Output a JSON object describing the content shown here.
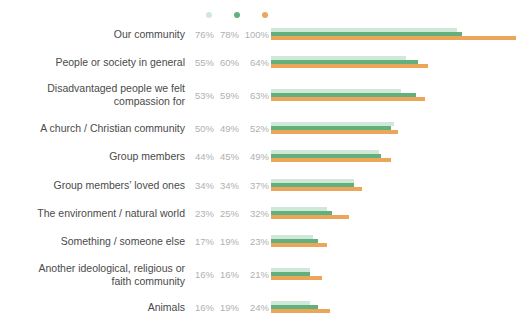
{
  "chart_data": {
    "type": "bar",
    "orientation": "horizontal",
    "title": "",
    "xlabel": "",
    "ylabel": "",
    "xlim": [
      0,
      100
    ],
    "grid": false,
    "legend_position": "top",
    "value_suffix": "%",
    "categories": [
      "Our community",
      "People or society in general",
      "Disadvantaged people we felt\ncompassion for",
      "A church / Christian community",
      "Group members",
      "Group members’ loved ones",
      "The environment / natural world",
      "Something / someone else",
      "Another ideological, religious or\nfaith community",
      "Animals"
    ],
    "series": [
      {
        "name": "series-1",
        "color": "#cfe8da",
        "values": [
          76,
          55,
          53,
          50,
          44,
          34,
          23,
          17,
          16,
          16
        ],
        "labels": [
          "76%",
          "55%",
          "53%",
          "50%",
          "44%",
          "34%",
          "23%",
          "17%",
          "16%",
          "16%"
        ]
      },
      {
        "name": "series-2",
        "color": "#62b07c",
        "values": [
          78,
          60,
          59,
          49,
          45,
          34,
          25,
          19,
          16,
          19
        ],
        "labels": [
          "78%",
          "60%",
          "59%",
          "49%",
          "45%",
          "34%",
          "25%",
          "19%",
          "16%",
          "19%"
        ]
      },
      {
        "name": "series-3",
        "color": "#eba65a",
        "values": [
          100,
          64,
          63,
          52,
          49,
          37,
          32,
          23,
          21,
          24
        ],
        "labels": [
          "100%",
          "64%",
          "63%",
          "52%",
          "49%",
          "37%",
          "32%",
          "23%",
          "21%",
          "24%"
        ]
      }
    ]
  },
  "colors": {
    "background": "#ffffff",
    "label_text": "#4a4a4a",
    "value_text": "#b0b0b0",
    "series_1": "#cfe8da",
    "series_2": "#62b07c",
    "series_3": "#eba65a"
  }
}
